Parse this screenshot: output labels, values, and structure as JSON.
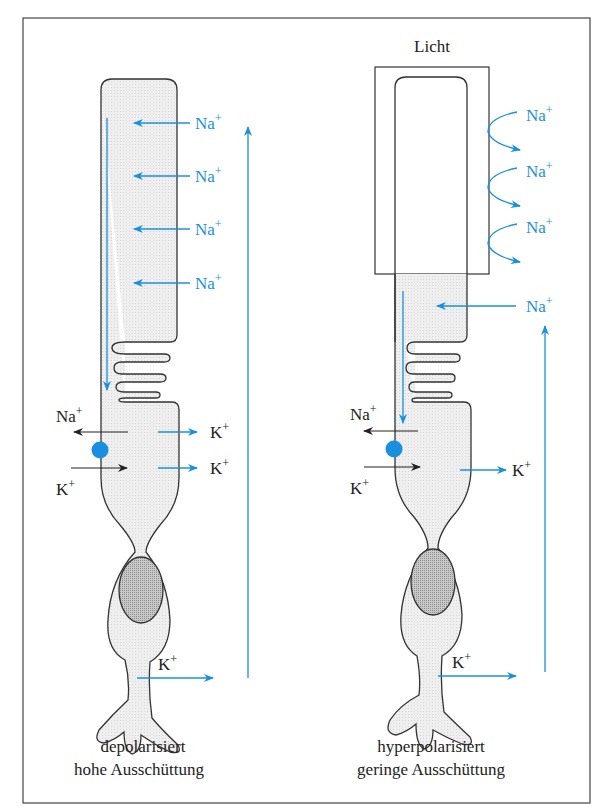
{
  "figure": {
    "colors": {
      "ion_flow": "#1a8fe0",
      "outline": "#333333",
      "cytoplasm_fill": "#ececec",
      "nucleus_fill": "#bdbdbd",
      "channel_dot": "#1a8fe0",
      "frame": "#444444"
    },
    "left_cell": {
      "state_label": "depolarisiert",
      "release_label": "hohe Ausschüttung",
      "outer_segment_ions": [
        "Na+",
        "Na+",
        "Na+",
        "Na+"
      ],
      "inner_segment": {
        "na_out_label": "Na",
        "na_out_sup": "+",
        "k_in_label": "K",
        "k_in_sup": "+",
        "k_out_labels": [
          "K",
          "K"
        ],
        "k_out_sup": "+"
      },
      "terminal_k_label": "K",
      "terminal_k_sup": "+",
      "na_label": "Na",
      "na_sup": "+"
    },
    "right_cell": {
      "stimulus_label": "Licht",
      "state_label": "hyperpolarisiert",
      "release_label": "geringe Ausschüttung",
      "blocked_ions": [
        "Na+",
        "Na+",
        "Na+"
      ],
      "inner_segment_ion": "Na+",
      "inner_segment": {
        "na_out_label": "Na",
        "na_out_sup": "+",
        "k_in_label": "K",
        "k_in_sup": "+",
        "k_out_label": "K",
        "k_out_sup": "+"
      },
      "terminal_k_label": "K",
      "terminal_k_sup": "+",
      "na_label": "Na",
      "na_sup": "+"
    }
  }
}
